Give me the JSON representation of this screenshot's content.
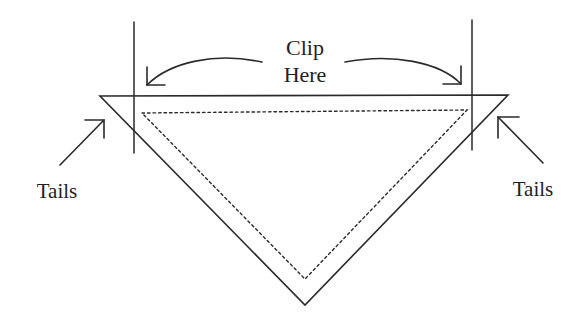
{
  "diagram": {
    "type": "cutting-instruction",
    "colors": {
      "stroke": "#2a2a2a",
      "text": "#222222",
      "background": "#ffffff"
    },
    "labels": {
      "clip_line1": "Clip",
      "clip_line2": "Here",
      "tails_left": "Tails",
      "tails_right": "Tails"
    },
    "shapes": {
      "outer_triangle": "solid",
      "inner_triangle": "dotted (seam line)",
      "clip_guides": "two vertical lines",
      "arrows": [
        "curved arrow left",
        "curved arrow right",
        "arrow to left tail",
        "arrow to right tail"
      ]
    }
  }
}
